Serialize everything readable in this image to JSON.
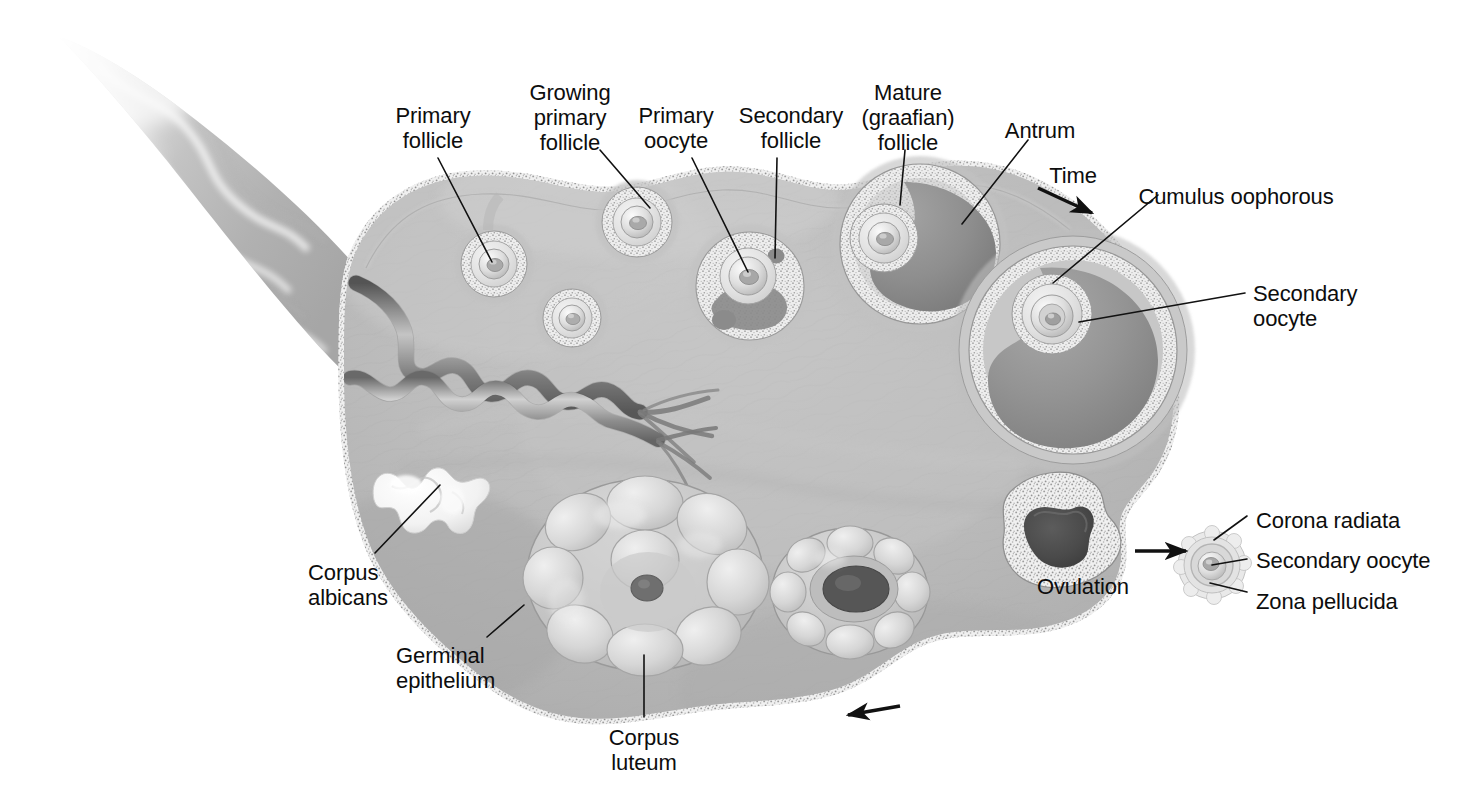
{
  "figure": {
    "type": "anatomical-diagram",
    "background_color": "#ffffff",
    "palette": {
      "stroma": "#b6b6b6",
      "stroma_light": "#c9c9c9",
      "stroma_dark": "#9a9a9a",
      "granulosa": "#e4e4e4",
      "antrum": "#8f8f8f",
      "antrum_dark": "#7d7d7d",
      "corpus_luteum": "#c6c6c6",
      "corpus_albicans": "#f4f4f4",
      "vessel_dark": "#6a6a6a",
      "outline": "#5d5d5d",
      "leader_line": "#111111",
      "text": "#0d0d0d"
    }
  },
  "labels": [
    {
      "id": "primary-follicle",
      "text": "Primary\nfollicle",
      "x": 433,
      "y": 103,
      "align": "ctr"
    },
    {
      "id": "growing-primary",
      "text": "Growing\nprimary\nfollicle",
      "x": 570,
      "y": 80,
      "align": "ctr"
    },
    {
      "id": "primary-oocyte",
      "text": "Primary\noocyte",
      "x": 676,
      "y": 103,
      "align": "ctr"
    },
    {
      "id": "secondary-follicle",
      "text": "Secondary\nfollicle",
      "x": 791,
      "y": 103,
      "align": "ctr"
    },
    {
      "id": "mature-graafian",
      "text": "Mature\n(graafian)\nfollicle",
      "x": 908,
      "y": 80,
      "align": "ctr"
    },
    {
      "id": "antrum",
      "text": "Antrum",
      "x": 1040,
      "y": 118,
      "align": "ctr"
    },
    {
      "id": "time",
      "text": "Time",
      "x": 1073,
      "y": 163,
      "align": "ctr"
    },
    {
      "id": "cumulus-oophorous",
      "text": "Cumulus oophorous",
      "x": 1236,
      "y": 184,
      "align": "ctr"
    },
    {
      "id": "secondary-oocyte-big",
      "text": "Secondary\noocyte",
      "x": 1253,
      "y": 281,
      "align": "lft"
    },
    {
      "id": "corona-radiata",
      "text": "Corona radiata",
      "x": 1256,
      "y": 508,
      "align": "lft"
    },
    {
      "id": "secondary-oocyte-sm",
      "text": "Secondary oocyte",
      "x": 1256,
      "y": 548,
      "align": "lft"
    },
    {
      "id": "zona-pellucida",
      "text": "Zona pellucida",
      "x": 1256,
      "y": 589,
      "align": "lft"
    },
    {
      "id": "ovulation",
      "text": "Ovulation",
      "x": 1129,
      "y": 574,
      "align": "rgt"
    },
    {
      "id": "corpus-albicans",
      "text": "Corpus\nalbicans",
      "x": 308,
      "y": 560,
      "align": "lft"
    },
    {
      "id": "germinal-epithelium",
      "text": "Germinal\nepithelium",
      "x": 396,
      "y": 643,
      "align": "lft"
    },
    {
      "id": "corpus-luteum",
      "text": "Corpus\nluteum",
      "x": 644,
      "y": 725,
      "align": "ctr"
    }
  ],
  "leaders": [
    {
      "id": "leader-primary-follicle",
      "from": [
        438,
        158
      ],
      "to": [
        492,
        262
      ]
    },
    {
      "id": "leader-growing-primary",
      "from": [
        600,
        150
      ],
      "to": [
        650,
        208
      ]
    },
    {
      "id": "leader-primary-oocyte",
      "from": [
        692,
        158
      ],
      "to": [
        748,
        272
      ]
    },
    {
      "id": "leader-secondary-follicle",
      "from": [
        777,
        158
      ],
      "to": [
        775,
        258
      ]
    },
    {
      "id": "leader-graafian",
      "from": [
        905,
        150
      ],
      "to": [
        900,
        205
      ]
    },
    {
      "id": "leader-antrum",
      "from": [
        1028,
        140
      ],
      "to": [
        962,
        224
      ]
    },
    {
      "id": "leader-cumulus",
      "from": [
        1158,
        195
      ],
      "to": [
        1053,
        283
      ]
    },
    {
      "id": "leader-secondary-oocyte-big",
      "from": [
        1245,
        293
      ],
      "to": [
        1079,
        322
      ]
    },
    {
      "id": "leader-corona-radiata",
      "from": [
        1247,
        516
      ],
      "to": [
        1214,
        540
      ]
    },
    {
      "id": "leader-secondary-oocyte-sm",
      "from": [
        1247,
        559
      ],
      "to": [
        1212,
        565
      ]
    },
    {
      "id": "leader-zona-pellucida",
      "from": [
        1247,
        592
      ],
      "to": [
        1210,
        583
      ]
    },
    {
      "id": "leader-corpus-albicans",
      "from": [
        375,
        553
      ],
      "to": [
        440,
        485
      ]
    },
    {
      "id": "leader-germinal-epithelium",
      "from": [
        487,
        637
      ],
      "to": [
        524,
        605
      ]
    },
    {
      "id": "leader-corpus-luteum",
      "from": [
        644,
        717
      ],
      "to": [
        644,
        655
      ]
    }
  ],
  "arrows": [
    {
      "id": "time-arrow",
      "from": [
        1038,
        188
      ],
      "to": [
        1092,
        213
      ]
    },
    {
      "id": "ovulation-arrow",
      "from": [
        1135,
        551
      ],
      "to": [
        1186,
        551
      ]
    },
    {
      "id": "cycle-arrow",
      "from": [
        900,
        706
      ],
      "to": [
        848,
        715
      ]
    }
  ],
  "structures": [
    {
      "id": "mesovarium",
      "name": "Mesovarium / broad ligament",
      "visible_label": false
    },
    {
      "id": "germinal-epithelium",
      "name": "Germinal epithelium (stippled outer border)",
      "visible_label": true
    },
    {
      "id": "primary-follicle-1",
      "name": "Primary follicle",
      "cx": 494,
      "cy": 264,
      "r": 38
    },
    {
      "id": "primary-follicle-2",
      "name": "Primary follicle",
      "cx": 572,
      "cy": 318,
      "r": 33
    },
    {
      "id": "growing-primary-1",
      "name": "Growing primary follicle",
      "cx": 637,
      "cy": 222,
      "r": 38
    },
    {
      "id": "secondary-follicle",
      "name": "Secondary follicle",
      "cx": 748,
      "cy": 283,
      "r": 54
    },
    {
      "id": "graafian-follicle",
      "name": "Mature (graafian) follicle",
      "cx": 920,
      "cy": 243,
      "r": 78
    },
    {
      "id": "large-antral",
      "name": "Large antral follicle with cumulus oophorous",
      "cx": 1073,
      "cy": 348,
      "r": 110
    },
    {
      "id": "ruptured-follicle",
      "name": "Ruptured follicle at ovulation",
      "cx": 1055,
      "cy": 540,
      "r": 56
    },
    {
      "id": "corpus-luteum",
      "name": "Corpus luteum",
      "cx": 645,
      "cy": 575,
      "r": 108
    },
    {
      "id": "degenerating-cl",
      "name": "Degenerating corpus luteum",
      "cx": 848,
      "cy": 592,
      "r": 70
    },
    {
      "id": "corpus-albicans",
      "name": "Corpus albicans",
      "cx": 430,
      "cy": 497,
      "r": 45
    },
    {
      "id": "released-oocyte",
      "name": "Released secondary oocyte with corona radiata and zona pellucida",
      "cx": 1212,
      "cy": 565,
      "r": 34
    },
    {
      "id": "blood-vessels",
      "name": "Coiled ovarian blood vessels (artery and vein)"
    }
  ]
}
